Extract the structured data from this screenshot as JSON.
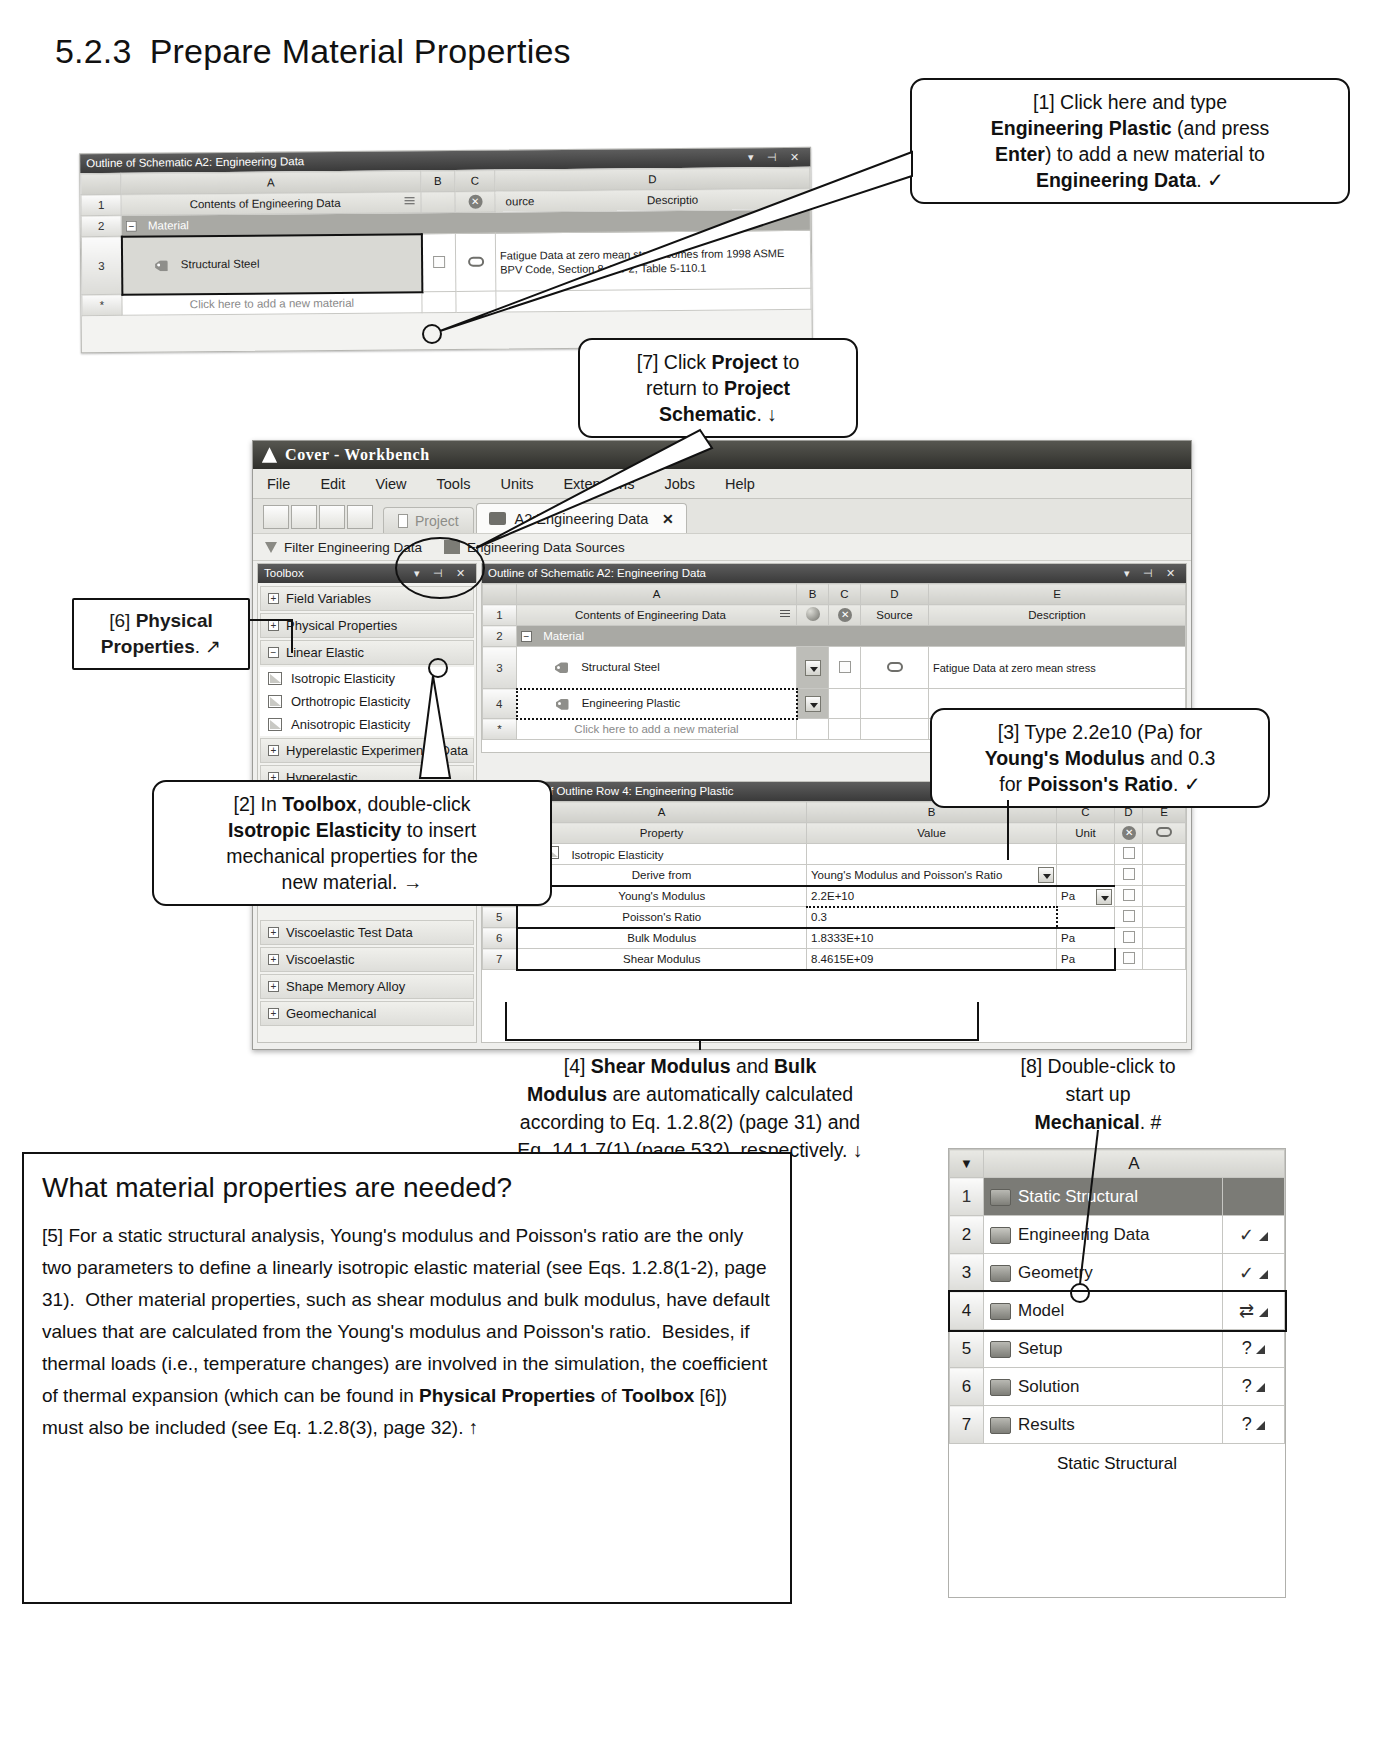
{
  "page": {
    "heading_number": "5.2.3",
    "heading_text": "Prepare Material Properties"
  },
  "top_table": {
    "title": "Outline of Schematic A2: Engineering Data",
    "window_controls": "▾ ⊣ ✕",
    "columns": [
      "A",
      "B",
      "C",
      "D"
    ],
    "rows": [
      {
        "num": "1",
        "a": "Contents of Engineering Data",
        "c": "ource",
        "d": "Descriptio"
      },
      {
        "num": "2",
        "a": "Material"
      },
      {
        "num": "3",
        "a": "Structural Steel",
        "d": "Fatigue Data at zero mean stress comes from 1998 ASME BPV Code, Section 8, Div 2, Table 5-110.1"
      },
      {
        "num": "*",
        "a": "Click here to add a new material"
      }
    ]
  },
  "workbench": {
    "title": "Cover - Workbench",
    "menu": [
      "File",
      "Edit",
      "View",
      "Tools",
      "Units",
      "Extensions",
      "Jobs",
      "Help"
    ],
    "tabs": [
      {
        "label": "Project"
      },
      {
        "label": "A2:Engineering Data",
        "close": "✕"
      }
    ],
    "toolbar2": [
      "Filter Engineering Data",
      "Engineering Data Sources"
    ]
  },
  "toolbox": {
    "title": "Toolbox",
    "window_controls": "▾ ⊣ ✕",
    "groups": [
      {
        "label": "Field Variables",
        "state": "+"
      },
      {
        "label": "Physical Properties",
        "state": "+"
      },
      {
        "label": "Linear Elastic",
        "state": "−"
      }
    ],
    "children": [
      "Isotropic Elasticity",
      "Orthotropic Elasticity",
      "Anisotropic Elasticity"
    ],
    "groups2": [
      {
        "label": "Hyperelastic Experimental Data",
        "state": "+"
      },
      {
        "label": "Hyperelastic",
        "state": "+"
      }
    ],
    "groups3": [
      {
        "label": "Viscoelastic Test Data",
        "state": "+"
      },
      {
        "label": "Viscoelastic",
        "state": "+"
      },
      {
        "label": "Shape Memory Alloy",
        "state": "+"
      },
      {
        "label": "Geomechanical",
        "state": "+"
      }
    ]
  },
  "outline": {
    "title": "Outline of Schematic A2: Engineering Data",
    "window_controls": "▾ ⊣ ✕",
    "columns": [
      "A",
      "B",
      "C",
      "D",
      "E"
    ],
    "header": {
      "a": "Contents of Engineering Data",
      "d": "Source",
      "e": "Description"
    },
    "rows": [
      {
        "num": "1"
      },
      {
        "num": "2",
        "a": "Material"
      },
      {
        "num": "3",
        "a": "Structural Steel",
        "e": "Fatigue Data at zero mean stress"
      },
      {
        "num": "4",
        "a": "Engineering Plastic"
      },
      {
        "num": "*",
        "a": "Click here to add a new material"
      }
    ]
  },
  "properties": {
    "title": "Properties of Outline Row 4: Engineering Plastic",
    "columns": [
      "A",
      "B",
      "C",
      "D",
      "E"
    ],
    "header": {
      "a": "Property",
      "b": "Value",
      "c": "Unit"
    },
    "rows": [
      {
        "num": "1"
      },
      {
        "num": "2",
        "property": "Isotropic Elasticity",
        "value": "",
        "unit": ""
      },
      {
        "num": "3",
        "property": "Derive from",
        "value": "Young's Modulus and Poisson's Ratio",
        "unit": "",
        "dropdown": true
      },
      {
        "num": "4",
        "property": "Young's Modulus",
        "value": "2.2E+10",
        "unit": "Pa",
        "unit_dropdown": true
      },
      {
        "num": "5",
        "property": "Poisson's Ratio",
        "value": "0.3",
        "unit": ""
      },
      {
        "num": "6",
        "property": "Bulk Modulus",
        "value": "1.8333E+10",
        "unit": "Pa"
      },
      {
        "num": "7",
        "property": "Shear Modulus",
        "value": "8.4615E+09",
        "unit": "Pa"
      }
    ]
  },
  "callouts": {
    "c1": "[1] Click here and type <b>Engineering Plastic</b> (and press <b>Enter</b>) to add a new material to <b>Engineering Data</b>. ✓",
    "c7": "[7] Click <b>Project</b> to return to <b>Project Schematic</b>. ↓",
    "c6": "[6] <b>Physical Properties</b>. ↗",
    "c2": "[2] In <b>Toolbox</b>, double-click <b>Isotropic Elasticity</b> to insert mechanical properties for the new material. →",
    "c3": "[3] Type 2.2e10 (Pa) for <b>Young's Modulus</b> and 0.3 for <b>Poisson's Ratio</b>. ✓",
    "c4": "[4] <b>Shear Modulus</b> and <b>Bulk Modulus</b> are automatically calculated according to Eq. 1.2.8(2) (page 31) and Eq. 14.1.7(1) (page 532), respectively. ↓",
    "c8": "[8] Double-click to start up <b>Mechanical</b>. #"
  },
  "infobox": {
    "title": "What material properties are needed?",
    "body": "[5] For a static structural analysis, Young's modulus and Poisson's ratio are the only two parameters to define a linearly isotropic elastic material (see Eqs. 1.2.8(1-2), page 31).  Other material properties, such as shear modulus and bulk modulus, have default values that are calculated from the Young's modulus and Poisson's ratio.  Besides, if thermal loads (i.e., temperature changes) are involved in the simulation, the coefficient of thermal expansion (which can be found in <b>Physical Properties</b> of <b>Toolbox</b> [6]) must also be included (see Eq. 1.2.8(3), page 32). ↑"
  },
  "project_schematic": {
    "column": "A",
    "caption": "Static Structural",
    "rows": [
      {
        "num": "1",
        "label": "Static Structural",
        "status": ""
      },
      {
        "num": "2",
        "label": "Engineering Data",
        "status": "✓"
      },
      {
        "num": "3",
        "label": "Geometry",
        "status": "✓"
      },
      {
        "num": "4",
        "label": "Model",
        "status": "⇄"
      },
      {
        "num": "5",
        "label": "Setup",
        "status": "?"
      },
      {
        "num": "6",
        "label": "Solution",
        "status": "?"
      },
      {
        "num": "7",
        "label": "Results",
        "status": "?"
      }
    ]
  }
}
